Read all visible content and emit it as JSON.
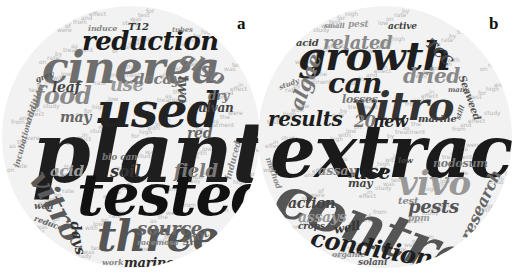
{
  "panels": [
    {
      "label": "a",
      "words": [
        {
          "text": "plants",
          "x": 30,
          "y": 105,
          "size": 84,
          "color": "#1e1e1e",
          "rot": 0
        },
        {
          "text": "tested",
          "x": 75,
          "y": 160,
          "size": 58,
          "color": "#111111",
          "rot": 0
        },
        {
          "text": "cinerea",
          "x": 40,
          "y": 40,
          "size": 44,
          "color": "#6e6e6e",
          "rot": 0
        },
        {
          "text": "used",
          "x": 95,
          "y": 80,
          "size": 48,
          "color": "#222222",
          "rot": 0
        },
        {
          "text": "reduction",
          "x": 80,
          "y": 22,
          "size": 26,
          "color": "#1a1a1a",
          "rot": 0
        },
        {
          "text": "three",
          "x": 95,
          "y": 210,
          "size": 42,
          "color": "#555555",
          "rot": 0
        },
        {
          "text": "vitro",
          "x": 48,
          "y": 160,
          "size": 30,
          "color": "#5a5a5a",
          "rot": 60
        },
        {
          "text": "food",
          "x": 32,
          "y": 78,
          "size": 24,
          "color": "#8a8a8a",
          "rot": 0
        },
        {
          "text": "also",
          "x": 186,
          "y": 40,
          "size": 22,
          "color": "#777777",
          "rot": 30
        },
        {
          "text": "use",
          "x": 108,
          "y": 70,
          "size": 18,
          "color": "#9a9a9a",
          "rot": 0
        },
        {
          "text": "decay",
          "x": 132,
          "y": 66,
          "size": 15,
          "color": "#7a7a7a",
          "rot": 0
        },
        {
          "text": "leaf",
          "x": 50,
          "y": 74,
          "size": 14,
          "color": "#444444",
          "rot": 0
        },
        {
          "text": "two",
          "x": 188,
          "y": 70,
          "size": 14,
          "color": "#555555",
          "rot": 90
        },
        {
          "text": "may",
          "x": 58,
          "y": 104,
          "size": 14,
          "color": "#666666",
          "rot": 0
        },
        {
          "text": "soil",
          "x": 108,
          "y": 158,
          "size": 16,
          "color": "#333333",
          "rot": 0
        },
        {
          "text": "field",
          "x": 172,
          "y": 156,
          "size": 18,
          "color": "#7a7a7a",
          "rot": 0
        },
        {
          "text": "source",
          "x": 135,
          "y": 214,
          "size": 18,
          "color": "#666666",
          "rot": 0
        },
        {
          "text": "acid",
          "x": 48,
          "y": 158,
          "size": 15,
          "color": "#9a9a9a",
          "rot": 0
        },
        {
          "text": "days",
          "x": 80,
          "y": 214,
          "size": 14,
          "color": "#333333",
          "rot": 80
        },
        {
          "text": "marine",
          "x": 122,
          "y": 250,
          "size": 13,
          "color": "#2a2a2a",
          "rot": 0
        },
        {
          "text": "spot",
          "x": 178,
          "y": 230,
          "size": 12,
          "color": "#666666",
          "rot": -20
        },
        {
          "text": "red",
          "x": 185,
          "y": 120,
          "size": 14,
          "color": "#666666",
          "rot": 0
        },
        {
          "text": "ulvan",
          "x": 196,
          "y": 96,
          "size": 12,
          "color": "#444444",
          "rot": 0
        },
        {
          "text": "dry",
          "x": 206,
          "y": 84,
          "size": 12,
          "color": "#777777",
          "rot": 0
        },
        {
          "text": "T12",
          "x": 126,
          "y": 16,
          "size": 10,
          "color": "#333333",
          "rot": 0
        },
        {
          "text": "induce",
          "x": 86,
          "y": 18,
          "size": 8,
          "color": "#888888",
          "rot": 0
        },
        {
          "text": "grey",
          "x": 32,
          "y": 70,
          "size": 8,
          "color": "#555555",
          "rot": -20
        },
        {
          "text": "addition",
          "x": 22,
          "y": 115,
          "size": 9,
          "color": "#777777",
          "rot": -70
        },
        {
          "text": "incubation",
          "x": 10,
          "y": 160,
          "size": 8,
          "color": "#777777",
          "rot": -75
        },
        {
          "text": "bio can",
          "x": 100,
          "y": 147,
          "size": 9,
          "color": "#777777",
          "rot": 0
        },
        {
          "text": "induced",
          "x": 222,
          "y": 172,
          "size": 9,
          "color": "#888888",
          "rot": -75
        },
        {
          "text": "racemosa",
          "x": 135,
          "y": 232,
          "size": 8,
          "color": "#888888",
          "rot": 0
        },
        {
          "text": "well",
          "x": 32,
          "y": 196,
          "size": 9,
          "color": "#555555",
          "rot": 0
        },
        {
          "text": "reduce",
          "x": 34,
          "y": 208,
          "size": 8,
          "color": "#666666",
          "rot": 20
        },
        {
          "text": "work",
          "x": 100,
          "y": 252,
          "size": 8,
          "color": "#888888",
          "rot": 0
        },
        {
          "text": "tubes",
          "x": 170,
          "y": 20,
          "size": 7,
          "color": "#888888",
          "rot": 0
        }
      ]
    },
    {
      "label": "b",
      "words": [
        {
          "text": "extracts",
          "x": 12,
          "y": 110,
          "size": 72,
          "color": "#1a1a1a",
          "rot": 0
        },
        {
          "text": "control",
          "x": 30,
          "y": 160,
          "size": 58,
          "color": "#555555",
          "rot": 20
        },
        {
          "text": "growth",
          "x": 40,
          "y": 30,
          "size": 40,
          "color": "#1e1e1e",
          "rot": 0
        },
        {
          "text": "vitro",
          "x": 95,
          "y": 80,
          "size": 40,
          "color": "#333333",
          "rot": 0
        },
        {
          "text": "can",
          "x": 70,
          "y": 64,
          "size": 28,
          "color": "#222222",
          "rot": 0
        },
        {
          "text": "vivo",
          "x": 140,
          "y": 160,
          "size": 34,
          "color": "#999999",
          "rot": 0
        },
        {
          "text": "conditions",
          "x": 55,
          "y": 220,
          "size": 24,
          "color": "#1e1e1e",
          "rot": 10
        },
        {
          "text": "results",
          "x": 10,
          "y": 103,
          "size": 20,
          "color": "#1e1e1e",
          "rot": 0
        },
        {
          "text": "related",
          "x": 65,
          "y": 28,
          "size": 18,
          "color": "#888888",
          "rot": 0
        },
        {
          "text": "dried",
          "x": 145,
          "y": 60,
          "size": 20,
          "color": "#888888",
          "rot": 0
        },
        {
          "text": "algae",
          "x": 28,
          "y": 100,
          "size": 20,
          "color": "#777777",
          "rot": -70
        },
        {
          "text": "TCC",
          "x": 175,
          "y": 30,
          "size": 14,
          "color": "#444444",
          "rot": 45
        },
        {
          "text": "new",
          "x": 115,
          "y": 108,
          "size": 16,
          "color": "#222222",
          "rot": 0
        },
        {
          "text": "20",
          "x": 96,
          "y": 108,
          "size": 16,
          "color": "#777777",
          "rot": 0
        },
        {
          "text": "use",
          "x": 95,
          "y": 156,
          "size": 20,
          "color": "#1e1e1e",
          "rot": 0
        },
        {
          "text": "pests",
          "x": 150,
          "y": 192,
          "size": 18,
          "color": "#555555",
          "rot": 0
        },
        {
          "text": "research",
          "x": 200,
          "y": 230,
          "size": 16,
          "color": "#666666",
          "rot": -65
        },
        {
          "text": "Seaweed",
          "x": 208,
          "y": 68,
          "size": 10,
          "color": "#555555",
          "rot": 70
        },
        {
          "text": "losses",
          "x": 84,
          "y": 88,
          "size": 11,
          "color": "#777777",
          "rot": 0
        },
        {
          "text": "assay",
          "x": 60,
          "y": 158,
          "size": 13,
          "color": "#888888",
          "rot": 0
        },
        {
          "text": "assays",
          "x": 40,
          "y": 204,
          "size": 14,
          "color": "#999999",
          "rot": 0
        },
        {
          "text": "action",
          "x": 30,
          "y": 190,
          "size": 14,
          "color": "#444444",
          "rot": 0
        },
        {
          "text": "may",
          "x": 90,
          "y": 172,
          "size": 11,
          "color": "#444444",
          "rot": 0
        },
        {
          "text": "nodosum",
          "x": 175,
          "y": 152,
          "size": 11,
          "color": "#777777",
          "rot": 0
        },
        {
          "text": "test",
          "x": 140,
          "y": 190,
          "size": 10,
          "color": "#888888",
          "rot": 0
        },
        {
          "text": "well",
          "x": 75,
          "y": 218,
          "size": 12,
          "color": "#333333",
          "rot": -10
        },
        {
          "text": "crops",
          "x": 40,
          "y": 216,
          "size": 9,
          "color": "#444444",
          "rot": 0
        },
        {
          "text": "solani",
          "x": 100,
          "y": 252,
          "size": 9,
          "color": "#555555",
          "rot": 0
        },
        {
          "text": "organic",
          "x": 74,
          "y": 244,
          "size": 8,
          "color": "#888888",
          "rot": 0
        },
        {
          "text": "marine",
          "x": 160,
          "y": 108,
          "size": 10,
          "color": "#444444",
          "rot": 0
        },
        {
          "text": "acid",
          "x": 38,
          "y": 32,
          "size": 10,
          "color": "#444444",
          "rot": 0
        },
        {
          "text": "active",
          "x": 130,
          "y": 16,
          "size": 9,
          "color": "#444444",
          "rot": 0
        },
        {
          "text": "pest",
          "x": 90,
          "y": 14,
          "size": 9,
          "color": "#999999",
          "rot": 0
        },
        {
          "text": "small",
          "x": 66,
          "y": 16,
          "size": 7,
          "color": "#888888",
          "rot": 0
        },
        {
          "text": "many",
          "x": 190,
          "y": 80,
          "size": 7,
          "color": "#666666",
          "rot": 0
        },
        {
          "text": "method",
          "x": 14,
          "y": 150,
          "size": 8,
          "color": "#888888",
          "rot": 70
        },
        {
          "text": "low",
          "x": 140,
          "y": 150,
          "size": 8,
          "color": "#444444",
          "rot": 0
        },
        {
          "text": "ppm",
          "x": 150,
          "y": 208,
          "size": 9,
          "color": "#999999",
          "rot": 0
        },
        {
          "text": "still",
          "x": 196,
          "y": 112,
          "size": 7,
          "color": "#666666",
          "rot": -70
        },
        {
          "text": "study",
          "x": 20,
          "y": 78,
          "size": 7,
          "color": "#777777",
          "rot": -20
        }
      ]
    }
  ]
}
